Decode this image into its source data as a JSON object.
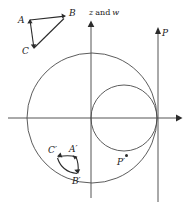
{
  "figure": {
    "type": "conformal-mapping-diagram",
    "background": "#ffffff",
    "stroke_color": "#4a4a4a",
    "label_color": "#1a1a1a",
    "width": 184,
    "height": 205,
    "axes": {
      "vertical_axis_label": "z and w",
      "vertical_axis_label_plain": "and",
      "vertical_axis_label_sym1": "z",
      "vertical_axis_label_sym2": "w",
      "origin_x": 91,
      "origin_y": 118,
      "x_axis_arrow": "right",
      "y_axis_arrow": "up"
    },
    "circles": [
      {
        "name": "outer-circle",
        "cx": 92,
        "cy": 118,
        "r": 65
      },
      {
        "name": "inner-circle",
        "cx": 124,
        "cy": 118,
        "r": 33
      }
    ],
    "vertical_line": {
      "name": "line-P",
      "x": 158,
      "y_top": 33,
      "y_bottom": 202,
      "label": "P",
      "arrow": "up"
    },
    "source_triangle": {
      "name": "triangle-ABC",
      "vertices": [
        {
          "label": "A",
          "x": 30,
          "y": 20
        },
        {
          "label": "B",
          "x": 66,
          "y": 16
        },
        {
          "label": "C",
          "x": 34,
          "y": 48
        }
      ],
      "label_positions": [
        {
          "label": "A",
          "x": 18,
          "y": 23
        },
        {
          "label": "B",
          "x": 69,
          "y": 16
        },
        {
          "label": "C",
          "x": 22,
          "y": 54
        }
      ]
    },
    "image_triangle": {
      "name": "triangle-A-prime-B-prime-C-prime",
      "labels": [
        {
          "label": "C′",
          "x": 50,
          "y": 152
        },
        {
          "label": "A′",
          "x": 72,
          "y": 151
        },
        {
          "label": "B′",
          "x": 74,
          "y": 179
        }
      ]
    },
    "points": [
      {
        "label": "P′",
        "x": 126,
        "y": 155,
        "label_x": 118,
        "label_y": 165
      }
    ]
  }
}
